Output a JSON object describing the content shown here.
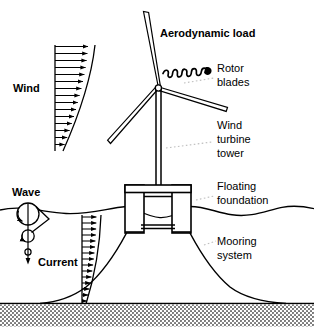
{
  "figure": {
    "kind": "floating-offshore-wind-turbine-load-diagram",
    "background_color": "#ffffff",
    "line_color": "#000000",
    "seabed_color": "#8a8a8a"
  },
  "load_labels": {
    "wind": "Wind",
    "wave": "Wave",
    "current": "Current",
    "aerodynamic_load": "Aerodynamic load"
  },
  "component_labels": {
    "rotor_blades_line1": "Rotor",
    "rotor_blades_line2": "blades",
    "tower_line1": "Wind",
    "tower_line2": "turbine",
    "tower_line3": "tower",
    "foundation_line1": "Floating",
    "foundation_line2": "foundation",
    "mooring_line1": "Mooring",
    "mooring_line2": "system"
  },
  "icons": {
    "wind_profile": "wind-velocity-profile-icon",
    "current_profile": "current-velocity-profile-icon",
    "wave_orbital": "wave-orbital-motion-icon",
    "aero_load_arrow": "coil-spring-arrow-icon",
    "turbine": "wind-turbine-icon",
    "foundation": "semisubmersible-foundation-icon",
    "mooring": "catenary-mooring-line-icon",
    "seabed": "seabed-stipple-icon",
    "waterline": "water-surface-wave-icon"
  },
  "profiles": {
    "wind_arrow_count": 15,
    "current_arrow_count": 15
  }
}
